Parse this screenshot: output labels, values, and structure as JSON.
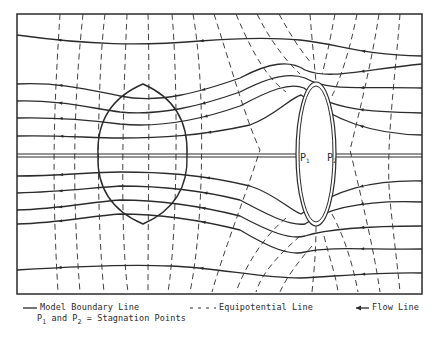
{
  "diagram": {
    "frame": {
      "x": 17,
      "y": 14,
      "w": 405,
      "h": 280
    },
    "colors": {
      "line": "#2b2b2b",
      "background": "#ffffff"
    },
    "centerline_y": 155,
    "left_body": {
      "label": "lens-shaped body",
      "top": [
        143,
        84
      ],
      "bottom": [
        143,
        224
      ],
      "left_x": 98,
      "right_x": 187
    },
    "right_body": {
      "label": "elliptical body",
      "cx": 316,
      "cy": 154,
      "rx": 20,
      "ry": 72
    },
    "stagnation_points": [
      {
        "id": "P1",
        "label": "P",
        "sub": "1",
        "x": 300,
        "y": 157
      },
      {
        "id": "P2",
        "label": "P",
        "sub": "2",
        "x": 327,
        "y": 157
      }
    ],
    "flow_lines": [
      "M17,35 C90,45 140,46 200,41 C250,37 280,38 300,40 C340,44 360,55 422,56",
      "M17,84 C60,82 90,90 120,96 C160,104 200,92 240,78 C270,62 290,60 305,70 C330,80 360,70 422,64",
      "M17,101 C60,100 90,108 120,112 C160,116 200,106 240,92 C270,76 290,72 305,78 C330,92 360,86 422,88",
      "M17,118 C60,117 90,120 120,124 C160,128 200,120 240,106 C270,90 290,82 304,88 C330,110 370,112 422,113",
      "M17,136 C60,135 90,138 120,138 C160,138 200,136 250,125 C275,116 290,98 301,95 C335,120 370,134 422,135",
      "M17,176 C60,176 90,172 120,172 C160,172 200,174 250,186 C275,194 290,210 301,214 C335,190 370,180 422,181",
      "M17,193 C60,192 90,188 120,186 C160,186 200,190 240,200 C270,216 290,226 305,224 C330,206 370,200 422,202",
      "M17,210 C60,209 90,202 120,200 C160,200 200,206 240,216 C270,232 290,240 305,236 C330,228 370,226 422,226",
      "M17,224 C60,223 90,216 120,214 C160,214 200,220 240,230 C270,248 290,256 305,252 C330,246 370,250 422,249",
      "M17,270 C80,266 130,264 170,266 C220,268 260,278 300,278 C340,276 380,272 422,273"
    ],
    "centerline_segments": [
      "M17,154 L296,154",
      "M17,157 L296,157",
      "M336,154 L422,154",
      "M336,157 L422,157"
    ],
    "equipotential_lines": [
      "M60,14 C56,80 50,160 58,292",
      "M83,14 C76,80 70,170 80,292",
      "M105,14 C98,70 95,200 104,292",
      "M127,14 C125,60 118,220 128,292",
      "M148,14 C150,80 148,220 148,292",
      "M172,14 C178,80 178,230 168,292",
      "M193,14 C205,80 205,220 190,292",
      "M214,14 C232,70 246,120 260,150 C244,200 224,250 212,292",
      "M236,14 C255,60 270,80 286,92 M286,218 C260,240 244,270 236,292",
      "M257,14 C270,40 285,60 300,74 M300,236 C280,254 262,272 256,292",
      "M279,14 C290,34 300,50 312,64 M312,246 C298,262 286,278 280,292",
      "M310,14 C312,40 314,60 316,82 M316,226 C316,250 314,272 312,292",
      "M335,14 C330,40 326,60 322,74 M324,236 C330,260 336,276 338,292",
      "M357,14 C350,50 340,80 332,96 M332,214 C346,240 354,270 358,292",
      "M379,14 C372,60 360,110 350,150 C362,200 374,250 380,292",
      "M400,14 C395,80 385,150 390,200 C394,240 398,270 400,292"
    ]
  },
  "legend": {
    "boundary": "Model Boundary Line",
    "equipotential": "Equipotential Line",
    "flow": "Flow Line",
    "stagnation": {
      "p1": "P",
      "p1_sub": "1",
      "and": " and ",
      "p2": "P",
      "p2_sub": "2",
      "rest": " = Stagnation Points"
    }
  }
}
